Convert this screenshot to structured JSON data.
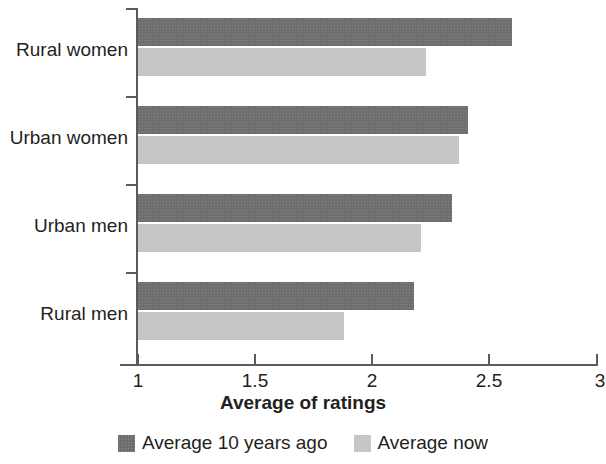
{
  "chart_data": {
    "type": "bar",
    "orientation": "horizontal",
    "title": "",
    "xlabel": "Average of ratings",
    "ylabel": "",
    "xlim": [
      1,
      3
    ],
    "xticks": [
      "1",
      "1.5",
      "2",
      "2.5",
      "3"
    ],
    "xtick_values": [
      1,
      1.5,
      2,
      2.5,
      3
    ],
    "grid": false,
    "legend_position": "bottom",
    "categories": [
      "Rural women",
      "Urban women",
      "Urban men",
      "Rural men"
    ],
    "series": [
      {
        "name": "Average 10 years ago",
        "color": "#6e6e6e",
        "values": [
          2.6,
          2.41,
          2.34,
          2.18
        ]
      },
      {
        "name": "Average now",
        "color": "#c5c5c5",
        "values": [
          2.23,
          2.37,
          2.21,
          1.88
        ]
      }
    ]
  },
  "axis": {
    "x_title": "Average of ratings"
  },
  "legend": {
    "items": [
      {
        "label": "Average 10 years ago",
        "swatch": "dark"
      },
      {
        "label": "Average now",
        "swatch": "light"
      }
    ]
  }
}
